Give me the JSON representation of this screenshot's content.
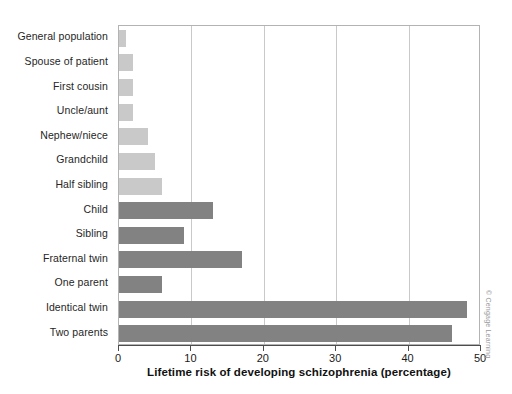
{
  "chart_data": {
    "type": "bar",
    "orientation": "horizontal",
    "title": "",
    "xlabel": "Lifetime risk of developing schizophrenia (percentage)",
    "ylabel": "",
    "xlim": [
      0,
      50
    ],
    "xticks": [
      "0",
      "10",
      "20",
      "30",
      "40",
      "50"
    ],
    "xtick_values": [
      0,
      10,
      20,
      30,
      40,
      50
    ],
    "grid": "vertical",
    "legend": "none",
    "categories": [
      "General population",
      "Spouse of patient",
      "First cousin",
      "Uncle/aunt",
      "Nephew/niece",
      "Grandchild",
      "Half sibling",
      "Child",
      "Sibling",
      "Fraternal twin",
      "One parent",
      "Identical twin",
      "Two parents"
    ],
    "values": [
      1,
      2,
      2,
      2,
      4,
      5,
      6,
      13,
      9,
      17,
      6,
      48,
      46
    ],
    "bar_shades": [
      "light",
      "light",
      "light",
      "light",
      "light",
      "light",
      "light",
      "dark",
      "dark",
      "dark",
      "dark",
      "dark",
      "dark"
    ],
    "colors": {
      "light_bar": "#c9c9c9",
      "dark_bar": "#828282",
      "gridline": "#c9c9c9",
      "axis": "#4d4d4d",
      "frame": "#b3b3b3",
      "text": "#1a1a1a",
      "background": "#ffffff"
    }
  },
  "credit": "© Cengage Learning"
}
